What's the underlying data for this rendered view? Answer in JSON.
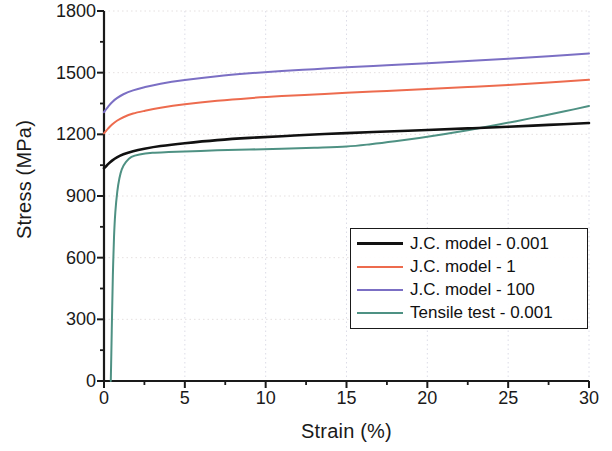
{
  "chart_data": {
    "type": "line",
    "title": "",
    "xlabel": "Strain (%)",
    "ylabel": "Stress (MPa)",
    "xlim": [
      0,
      30
    ],
    "ylim": [
      0,
      1800
    ],
    "xticks": [
      0,
      5,
      10,
      15,
      20,
      25,
      30
    ],
    "yticks": [
      0,
      300,
      600,
      900,
      1200,
      1500,
      1800
    ],
    "xtick_labels": [
      "0",
      "5",
      "10",
      "15",
      "20",
      "25",
      "30"
    ],
    "ytick_labels": [
      "0",
      "300",
      "600",
      "900",
      "1200",
      "1500",
      "1800"
    ],
    "minor_tick_count": 1,
    "grid": "faint-dotted",
    "legend_position": "center-right",
    "series": [
      {
        "name": "J.C. model - 0.001",
        "color": "#111111",
        "x": [
          0,
          0.1,
          0.25,
          0.5,
          0.8,
          1.2,
          1.8,
          2.5,
          3.5,
          5,
          7,
          9,
          11,
          13,
          15,
          17.5,
          20,
          22.5,
          25,
          27.5,
          30
        ],
        "y": [
          1035,
          1042,
          1055,
          1072,
          1088,
          1103,
          1118,
          1130,
          1143,
          1157,
          1172,
          1183,
          1191,
          1199,
          1206,
          1214,
          1221,
          1229,
          1237,
          1246,
          1255
        ]
      },
      {
        "name": "J.C. model - 1",
        "color": "#ED6B4E",
        "x": [
          0,
          0.1,
          0.25,
          0.5,
          0.8,
          1.2,
          1.8,
          2.5,
          3.5,
          5,
          7,
          9,
          11,
          13,
          15,
          17.5,
          20,
          22.5,
          25,
          27.5,
          30
        ],
        "y": [
          1205,
          1214,
          1228,
          1248,
          1266,
          1283,
          1301,
          1314,
          1329,
          1346,
          1363,
          1376,
          1386,
          1394,
          1402,
          1411,
          1420,
          1430,
          1440,
          1452,
          1465
        ]
      },
      {
        "name": "J.C. model - 100",
        "color": "#7B6FC4",
        "x": [
          0,
          0.1,
          0.25,
          0.5,
          0.8,
          1.2,
          1.8,
          2.5,
          3.5,
          5,
          7,
          9,
          11,
          13,
          15,
          17.5,
          20,
          22.5,
          25,
          27.5,
          30
        ],
        "y": [
          1308,
          1319,
          1334,
          1356,
          1376,
          1395,
          1414,
          1429,
          1446,
          1464,
          1483,
          1497,
          1508,
          1517,
          1526,
          1536,
          1546,
          1557,
          1568,
          1580,
          1593
        ]
      },
      {
        "name": "Tensile test - 0.001",
        "color": "#4E9183",
        "x": [
          0.42,
          0.45,
          0.5,
          0.55,
          0.62,
          0.7,
          0.82,
          0.95,
          1.1,
          1.35,
          1.7,
          2.2,
          3,
          4,
          5.5,
          7,
          9,
          11,
          13,
          15,
          16.5,
          18,
          19.5,
          21,
          22.5,
          24,
          25.5,
          27,
          28.5,
          30
        ],
        "y": [
          0,
          120,
          330,
          520,
          700,
          820,
          920,
          985,
          1030,
          1065,
          1090,
          1102,
          1110,
          1114,
          1118,
          1122,
          1126,
          1130,
          1135,
          1141,
          1152,
          1166,
          1182,
          1200,
          1220,
          1242,
          1264,
          1288,
          1312,
          1338
        ]
      }
    ]
  },
  "legend": {
    "items": [
      {
        "label": "J.C. model - 0.001",
        "color": "#111111",
        "width": 3.2
      },
      {
        "label": "J.C. model - 1",
        "color": "#ED6B4E",
        "width": 2.2
      },
      {
        "label": "J.C. model - 100",
        "color": "#7B6FC4",
        "width": 2.2
      },
      {
        "label": "Tensile test - 0.001",
        "color": "#4E9183",
        "width": 2.2
      }
    ]
  },
  "axes": {
    "y_title": "Stress (MPa)",
    "x_title": "Strain (%)"
  }
}
